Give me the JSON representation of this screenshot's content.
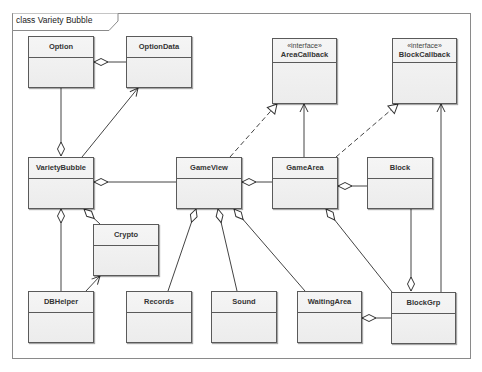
{
  "frame": {
    "title": "class Variety Bubble"
  },
  "classes": {
    "option": {
      "name": "Option"
    },
    "option_data": {
      "name": "OptionData"
    },
    "area_callback": {
      "stereotype": "«interface»",
      "name": "AreaCallback"
    },
    "block_callback": {
      "stereotype": "«interface»",
      "name": "BlockCallback"
    },
    "variety_bubble": {
      "name": "VarietyBubble"
    },
    "game_view": {
      "name": "GameView"
    },
    "game_area": {
      "name": "GameArea"
    },
    "block": {
      "name": "Block"
    },
    "crypto": {
      "name": "Crypto"
    },
    "db_helper": {
      "name": "DBHelper"
    },
    "records": {
      "name": "Records"
    },
    "sound": {
      "name": "Sound"
    },
    "waiting_area": {
      "name": "WaitingArea"
    },
    "block_grp": {
      "name": "BlockGrp"
    }
  },
  "relationships": [
    {
      "from": "Option",
      "to": "OptionData",
      "type": "aggregation"
    },
    {
      "from": "VarietyBubble",
      "to": "Option",
      "type": "aggregation"
    },
    {
      "from": "VarietyBubble",
      "to": "OptionData",
      "type": "association"
    },
    {
      "from": "VarietyBubble",
      "to": "GameView",
      "type": "aggregation"
    },
    {
      "from": "VarietyBubble",
      "to": "DBHelper",
      "type": "aggregation"
    },
    {
      "from": "VarietyBubble",
      "to": "Crypto",
      "type": "aggregation"
    },
    {
      "from": "DBHelper",
      "to": "Crypto",
      "type": "association"
    },
    {
      "from": "GameView",
      "to": "AreaCallback",
      "type": "realization"
    },
    {
      "from": "GameView",
      "to": "GameArea",
      "type": "aggregation"
    },
    {
      "from": "GameView",
      "to": "Records",
      "type": "aggregation"
    },
    {
      "from": "GameView",
      "to": "Sound",
      "type": "aggregation"
    },
    {
      "from": "GameView",
      "to": "WaitingArea",
      "type": "aggregation"
    },
    {
      "from": "GameArea",
      "to": "AreaCallback",
      "type": "association"
    },
    {
      "from": "GameArea",
      "to": "BlockCallback",
      "type": "realization"
    },
    {
      "from": "GameArea",
      "to": "Block",
      "type": "aggregation"
    },
    {
      "from": "GameArea",
      "to": "BlockGrp",
      "type": "aggregation"
    },
    {
      "from": "BlockGrp",
      "to": "Block",
      "type": "aggregation"
    },
    {
      "from": "BlockGrp",
      "to": "BlockCallback",
      "type": "association"
    },
    {
      "from": "WaitingArea",
      "to": "BlockGrp",
      "type": "aggregation"
    }
  ]
}
